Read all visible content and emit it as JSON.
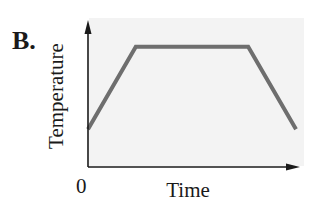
{
  "panel_label": "B.",
  "chart_data": {
    "type": "line",
    "title": "",
    "xlabel": "Time",
    "ylabel": "Temperature",
    "x_axis_symbol": "t",
    "y_axis_symbol": "d",
    "x_tick_labels": [
      "0"
    ],
    "grid": false,
    "legend": null,
    "x": [
      0,
      0.23,
      0.77,
      1.0
    ],
    "values": [
      0.26,
      0.83,
      0.83,
      0.26
    ],
    "xlim": [
      0,
      1.0
    ],
    "ylim": [
      0,
      1.0
    ],
    "series": [
      {
        "name": "Temperature",
        "x": [
          0,
          0.23,
          0.77,
          1.0
        ],
        "values": [
          0.26,
          0.83,
          0.83,
          0.26
        ]
      }
    ]
  },
  "style": {
    "line_color": "#6e6e6e",
    "axis_color": "#1a1a1a",
    "panel_bg": "#f3f3f3"
  }
}
